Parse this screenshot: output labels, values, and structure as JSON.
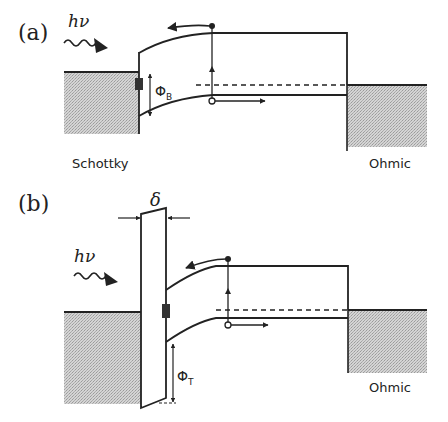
{
  "panels": [
    {
      "label": "(a)",
      "photon_label": "hν",
      "barrier_label": "Φ",
      "barrier_subscript": "B",
      "left_contact_label": "Schottky",
      "right_contact_label": "Ohmic"
    },
    {
      "label": "(b)",
      "photon_label": "hν",
      "thickness_label": "δ",
      "barrier_label": "Φ",
      "barrier_subscript": "T",
      "right_contact_label": "Ohmic"
    }
  ],
  "colors": {
    "line": "#222222",
    "metal_fill": "#c8c8c8",
    "background": "#ffffff"
  }
}
